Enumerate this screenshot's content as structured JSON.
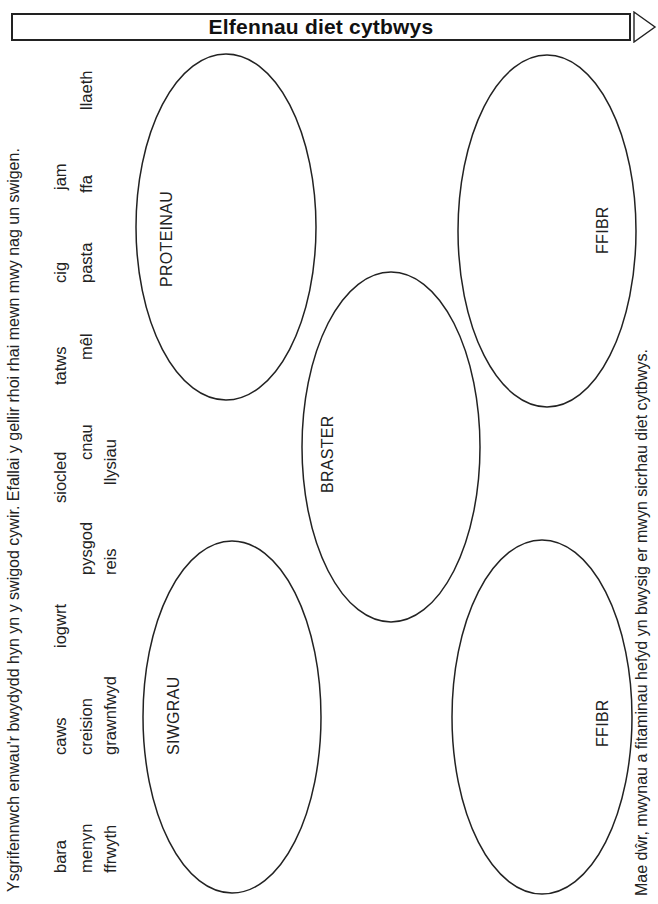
{
  "header": {
    "title": "Elfennau diet cytbwys"
  },
  "instructions": "Ysgrifennwch enwau'r bwydydd hyn yn y swigod cywir. Efallai y gellir rhoi rhai mewn mwy nag un swigen.",
  "food_words": {
    "line1": [
      "bara",
      "caws",
      "iogwrt",
      "siocled",
      "tatws",
      "cig",
      "jam"
    ],
    "line2": [
      "menyn",
      "creision",
      "pysgod",
      "cnau",
      "mêl",
      "pasta",
      "ffa",
      "llaeth"
    ],
    "line3": [
      "ffrwyth",
      "grawnfwyd",
      "reis",
      "llysiau"
    ]
  },
  "bubbles": [
    {
      "label": "PROTEINAU"
    },
    {
      "label": "FFIBR"
    },
    {
      "label": "BRASTER"
    },
    {
      "label": "SIWGRAU"
    },
    {
      "label": "FFIBR"
    }
  ],
  "footer": "Mae dŵr, mwynau a fitaminau hefyd yn bwysig er mwyn sicrhau diet cytbwys.",
  "colors": {
    "ink": "#1a1a1a",
    "paper": "#ffffff"
  }
}
